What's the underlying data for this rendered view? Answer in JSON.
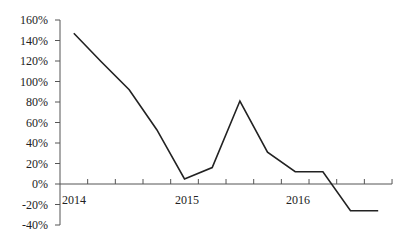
{
  "chart_data": {
    "type": "line",
    "title": "",
    "xlabel": "",
    "ylabel": "",
    "ylim": [
      -40,
      160
    ],
    "yticks": [
      "160%",
      "140%",
      "120%",
      "100%",
      "80%",
      "60%",
      "40%",
      "20%",
      "0%",
      "-20%",
      "-40%"
    ],
    "ytick_values": [
      160,
      140,
      120,
      100,
      80,
      60,
      40,
      20,
      0,
      -20,
      -40
    ],
    "x_category_labels": [
      "2014",
      "2015",
      "2016"
    ],
    "x_label_positions": [
      0,
      4,
      8
    ],
    "grid": false,
    "legend": null,
    "x": [
      1,
      2,
      3,
      4,
      5,
      6,
      7,
      8,
      9,
      10,
      11,
      12
    ],
    "series": [
      {
        "name": "series-1",
        "color": "#222222",
        "values": [
          147,
          119,
          92,
          53,
          5,
          16,
          81,
          31,
          12,
          12,
          -26,
          -26
        ]
      }
    ]
  },
  "colors": {
    "line": "#222222",
    "axis": "#555555",
    "background": "#ffffff"
  }
}
